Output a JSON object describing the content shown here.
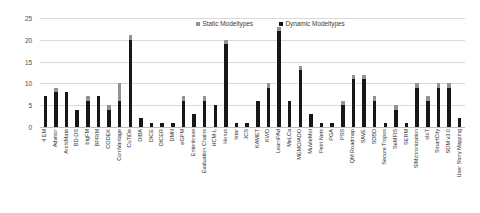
{
  "chart_data": {
    "type": "bar",
    "title": "",
    "subtitle": "",
    "xlabel": "",
    "ylabel": "",
    "ylim": [
      0,
      25
    ],
    "yticks": [
      0,
      5,
      10,
      15,
      20,
      25
    ],
    "grid": true,
    "stacked": true,
    "legend_position": "top-center",
    "colors": {
      "static": "#939393",
      "dynamic": "#171717",
      "gridline": "#d9d9d9",
      "axis_text": "#4d4d4d"
    },
    "categories": [
      "4 EM",
      "Advisor",
      "ArchiMate",
      "BD-DS",
      "bIgFM",
      "BPRIM",
      "CODEK",
      "ComVantage",
      "CuTiDe",
      "DIBA",
      "DICE",
      "DICER",
      "DMN",
      "eGPM",
      "Entenknow",
      "Evaluation Chains",
      "HCM-L",
      "Horus",
      "Istar",
      "JCS",
      "KAMET",
      "KWD",
      "LearnPAd",
      "MeLCa",
      "MEMO/ADO",
      "MuVieMot",
      "Petri Nets",
      "PGA",
      "PSS",
      "QM Roadmap",
      "SAVE",
      "SDBD",
      "Secure Tropos",
      "SeMFIS",
      "SERM",
      "SIMchronization",
      "sIoT",
      "SmartCity",
      "SOM v3.0",
      "User Story Mapping"
    ],
    "series": [
      {
        "name": "Dynamic Modeltypes",
        "values": [
          7,
          8,
          8,
          4,
          6,
          7,
          4,
          6,
          20,
          2,
          1,
          1,
          1,
          6,
          3,
          6,
          5,
          19,
          1,
          1,
          6,
          9,
          22,
          6,
          13,
          3,
          1,
          1,
          5,
          11,
          11,
          6,
          1,
          4,
          1,
          9,
          6,
          9,
          9,
          2
        ]
      },
      {
        "name": "Static Modeltypes",
        "values": [
          0,
          1,
          0,
          0,
          1,
          0,
          1,
          4,
          1,
          0,
          0,
          0,
          0,
          1,
          0,
          1,
          0,
          1,
          0,
          0,
          0,
          1,
          1,
          0,
          1,
          0,
          0,
          0,
          1,
          1,
          1,
          1,
          0,
          1,
          0,
          1,
          1,
          1,
          1,
          0
        ]
      }
    ],
    "totals": [
      7,
      9,
      8,
      4,
      7,
      7,
      5,
      10,
      21,
      2,
      1,
      1,
      1,
      7,
      3,
      7,
      5,
      20,
      1,
      1,
      6,
      10,
      23,
      6,
      14,
      3,
      1,
      1,
      6,
      12,
      12,
      7,
      1,
      5,
      1,
      10,
      7,
      10,
      10,
      2
    ]
  },
  "legend": {
    "items": [
      {
        "label": "Static Modeltypes",
        "key": "static"
      },
      {
        "label": "Dynamic Modeltypes",
        "key": "dynamic"
      }
    ]
  }
}
